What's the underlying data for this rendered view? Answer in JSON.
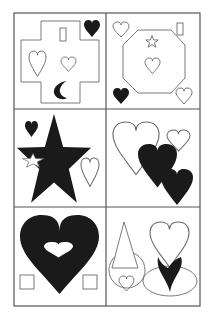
{
  "figure": {
    "type": "visual-puzzle-grid",
    "rows": 3,
    "cols": 2,
    "colors": {
      "ink": "#1a1a1a",
      "outline": "#6b6b6b",
      "grid": "#555555",
      "background": "#ffffff"
    },
    "panels": [
      {
        "id": "top-left",
        "shapes": [
          "cross-outline",
          "rectangle-outline",
          "heart-filled",
          "heart-outline-large",
          "heart-outline-small",
          "crescent-filled"
        ]
      },
      {
        "id": "top-right",
        "shapes": [
          "octagon-outline",
          "star-outline",
          "heart-outline-center",
          "heart-outline-topleft",
          "rectangle-outline",
          "heart-filled",
          "heart-outline-bottomright"
        ]
      },
      {
        "id": "middle-left",
        "shapes": [
          "star-filled-large",
          "star-outline-small",
          "heart-filled-small",
          "heart-outline-tall"
        ]
      },
      {
        "id": "middle-right",
        "shapes": [
          "heart-outline-large",
          "heart-outline-small",
          "heart-filled",
          "heart-filled"
        ]
      },
      {
        "id": "bottom-left",
        "shapes": [
          "heart-filled-large-with-heart-hole",
          "square-outline",
          "square-outline"
        ]
      },
      {
        "id": "bottom-right",
        "shapes": [
          "triangle-outline",
          "circle-outline",
          "heart-outline-small",
          "heart-outline",
          "ellipse-outline",
          "heart-filled-partial"
        ]
      }
    ]
  }
}
